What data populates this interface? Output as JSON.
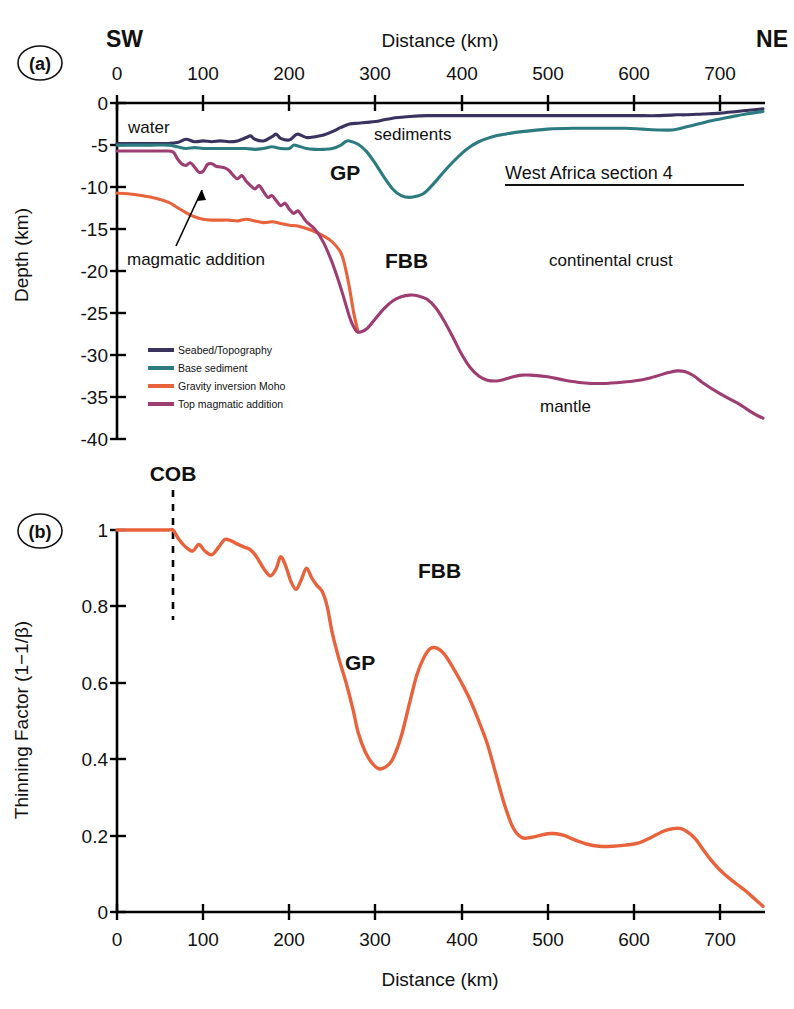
{
  "figure": {
    "caption_id_a": "(a)",
    "caption_id_b": "(b)",
    "orientation_left": "SW",
    "orientation_right": "NE",
    "section_title": "West Africa section 4"
  },
  "panel_a": {
    "axis": {
      "x_title": "Distance (km)",
      "y_title": "Depth (km)",
      "x_ticks": [
        "0",
        "100",
        "200",
        "300",
        "400",
        "500",
        "600",
        "700"
      ],
      "y_ticks": [
        "0",
        "-5",
        "-10",
        "-15",
        "-20",
        "-25",
        "-30",
        "-35",
        "-40"
      ]
    },
    "legend": [
      {
        "label": "Seabed/Topography",
        "color": "#3a3360"
      },
      {
        "label": "Base sediment",
        "color": "#2c7b80"
      },
      {
        "label": "Gravity inversion Moho",
        "color": "#e8623c"
      },
      {
        "label": "Top magmatic addition",
        "color": "#9e3d72"
      }
    ],
    "annotations": [
      {
        "name": "water",
        "text": "water"
      },
      {
        "name": "sediments",
        "text": "sediments"
      },
      {
        "name": "gp",
        "text": "GP"
      },
      {
        "name": "fbb",
        "text": "FBB"
      },
      {
        "name": "continental-crust",
        "text": "continental crust"
      },
      {
        "name": "mantle",
        "text": "mantle"
      },
      {
        "name": "magmatic-addition",
        "text": "magmatic addition"
      },
      {
        "name": "section-title",
        "text": "West Africa section 4"
      }
    ]
  },
  "panel_b": {
    "axis": {
      "x_title": "Distance (km)",
      "y_title": "Thinning Factor (1−1/β)",
      "x_ticks": [
        "0",
        "100",
        "200",
        "300",
        "400",
        "500",
        "600",
        "700"
      ],
      "y_ticks": [
        "0",
        "0.2",
        "0.4",
        "0.6",
        "0.8",
        "1"
      ]
    },
    "annotations": [
      {
        "name": "cob",
        "text": "COB"
      },
      {
        "name": "gp",
        "text": "GP"
      },
      {
        "name": "fbb",
        "text": "FBB"
      }
    ]
  },
  "chart_data": [
    {
      "type": "line",
      "id": "panel-a-crustal-section",
      "title": "West Africa section 4",
      "xlabel": "Distance (km)",
      "ylabel": "Depth (km)",
      "xlim": [
        0,
        750
      ],
      "ylim": [
        -40,
        0
      ],
      "grid": false,
      "legend_position": "lower-left",
      "series": [
        {
          "name": "Seabed/Topography",
          "color": "#3a3360",
          "x": [
            0,
            20,
            40,
            60,
            70,
            80,
            90,
            100,
            110,
            120,
            130,
            140,
            150,
            155,
            160,
            170,
            180,
            185,
            190,
            200,
            205,
            210,
            220,
            230,
            240,
            250,
            260,
            270,
            280,
            290,
            300,
            310,
            320,
            330,
            340,
            360,
            380,
            400,
            430,
            460,
            500,
            540,
            570,
            600,
            630,
            650,
            660,
            680,
            700,
            720,
            740,
            750
          ],
          "y": [
            -4.8,
            -4.8,
            -4.8,
            -4.8,
            -4.7,
            -4.3,
            -4.6,
            -4.5,
            -4.6,
            -4.5,
            -4.6,
            -4.5,
            -4.1,
            -3.9,
            -4.3,
            -4.5,
            -4.0,
            -3.7,
            -4.2,
            -4.4,
            -4.0,
            -3.7,
            -4.1,
            -4.0,
            -3.8,
            -3.4,
            -2.9,
            -2.5,
            -2.4,
            -2.3,
            -2.2,
            -2.0,
            -1.8,
            -1.7,
            -1.6,
            -1.5,
            -1.5,
            -1.5,
            -1.5,
            -1.5,
            -1.5,
            -1.5,
            -1.5,
            -1.5,
            -1.5,
            -1.4,
            -1.4,
            -1.3,
            -1.2,
            -1.0,
            -0.8,
            -0.7
          ]
        },
        {
          "name": "Base sediment",
          "color": "#2c7b80",
          "x": [
            0,
            20,
            40,
            60,
            70,
            80,
            90,
            100,
            110,
            120,
            130,
            140,
            150,
            160,
            170,
            180,
            190,
            200,
            205,
            210,
            220,
            230,
            240,
            250,
            260,
            265,
            270,
            280,
            290,
            300,
            310,
            320,
            330,
            340,
            350,
            355,
            360,
            370,
            380,
            390,
            400,
            410,
            420,
            430,
            440,
            450,
            470,
            500,
            530,
            560,
            590,
            610,
            630,
            645,
            655,
            670,
            690,
            710,
            730,
            750
          ],
          "y": [
            -5.0,
            -5.0,
            -5.0,
            -5.0,
            -5.2,
            -5.4,
            -5.3,
            -5.4,
            -5.4,
            -5.4,
            -5.4,
            -5.4,
            -5.4,
            -5.5,
            -5.4,
            -5.2,
            -5.4,
            -5.4,
            -5.0,
            -5.1,
            -5.4,
            -5.5,
            -5.5,
            -5.4,
            -5.0,
            -4.6,
            -4.5,
            -4.9,
            -5.8,
            -7.2,
            -8.8,
            -10.2,
            -11.0,
            -11.2,
            -11.0,
            -10.8,
            -10.4,
            -9.3,
            -8.1,
            -7.0,
            -6.0,
            -5.2,
            -4.6,
            -4.2,
            -3.9,
            -3.7,
            -3.4,
            -3.1,
            -3.0,
            -3.0,
            -3.0,
            -3.1,
            -3.2,
            -3.2,
            -3.0,
            -2.6,
            -2.1,
            -1.7,
            -1.3,
            -1.0
          ]
        },
        {
          "name": "Gravity inversion Moho",
          "color": "#e8623c",
          "x": [
            0,
            15,
            30,
            45,
            60,
            70,
            80,
            90,
            100,
            110,
            120,
            130,
            140,
            150,
            160,
            170,
            180,
            190,
            200,
            210,
            220,
            230,
            240,
            250,
            260,
            265,
            270,
            275,
            280
          ],
          "y": [
            -10.7,
            -10.8,
            -11.0,
            -11.3,
            -11.8,
            -12.4,
            -13.0,
            -13.5,
            -13.8,
            -13.9,
            -13.9,
            -13.9,
            -14.0,
            -13.8,
            -14.0,
            -14.2,
            -14.1,
            -14.3,
            -14.5,
            -14.6,
            -14.9,
            -15.3,
            -15.8,
            -16.5,
            -17.8,
            -19.5,
            -22.0,
            -25.0,
            -27.2
          ]
        },
        {
          "name": "Top magmatic addition",
          "color": "#9e3d72",
          "x": [
            0,
            20,
            40,
            55,
            65,
            70,
            75,
            80,
            85,
            90,
            95,
            100,
            105,
            110,
            115,
            120,
            125,
            130,
            135,
            140,
            145,
            150,
            155,
            160,
            165,
            170,
            175,
            180,
            185,
            190,
            195,
            200,
            205,
            210,
            215,
            220,
            230,
            240,
            250,
            260,
            270,
            275,
            280,
            290,
            300,
            310,
            320,
            330,
            340,
            350,
            360,
            370,
            380,
            390,
            400,
            410,
            420,
            430,
            440,
            450,
            460,
            470,
            480,
            500,
            520,
            540,
            560,
            580,
            600,
            620,
            640,
            650,
            660,
            670,
            680,
            700,
            720,
            740,
            750
          ],
          "y": [
            -5.7,
            -5.7,
            -5.7,
            -5.7,
            -5.8,
            -6.6,
            -7.2,
            -7.4,
            -7.1,
            -7.6,
            -8.2,
            -8.1,
            -7.3,
            -7.2,
            -7.5,
            -7.6,
            -7.7,
            -8.0,
            -8.6,
            -9.0,
            -8.6,
            -9.3,
            -9.8,
            -10.2,
            -9.8,
            -10.5,
            -11.2,
            -11.0,
            -11.6,
            -12.2,
            -11.9,
            -12.6,
            -13.1,
            -12.8,
            -13.4,
            -14.1,
            -15.0,
            -16.6,
            -19.0,
            -22.0,
            -25.4,
            -26.6,
            -27.2,
            -26.8,
            -25.6,
            -24.4,
            -23.5,
            -23.0,
            -22.8,
            -22.9,
            -23.3,
            -24.3,
            -25.9,
            -27.8,
            -29.8,
            -31.4,
            -32.4,
            -32.9,
            -33.0,
            -32.8,
            -32.5,
            -32.3,
            -32.3,
            -32.5,
            -32.9,
            -33.2,
            -33.3,
            -33.2,
            -33.0,
            -32.6,
            -32.0,
            -31.8,
            -31.9,
            -32.4,
            -33.2,
            -34.5,
            -35.6,
            -36.9,
            -37.4
          ]
        }
      ],
      "annotations": [
        {
          "text": "water",
          "x": 35,
          "y": -2.2
        },
        {
          "text": "sediments",
          "x": 400,
          "y": -3.2
        },
        {
          "text": "GP",
          "x": 285,
          "y": -8.4
        },
        {
          "text": "FBB",
          "x": 400,
          "y": -19.6
        },
        {
          "text": "continental crust",
          "x": 600,
          "y": -19.6
        },
        {
          "text": "mantle",
          "x": 565,
          "y": -36.5
        },
        {
          "text": "magmatic addition",
          "x": 60,
          "y": -23.4
        },
        {
          "text": "West Africa section 4",
          "x": 590,
          "y": -12.8
        }
      ]
    },
    {
      "type": "line",
      "id": "panel-b-thinning-factor",
      "title": "",
      "xlabel": "Distance (km)",
      "ylabel": "Thinning Factor (1−1/β)",
      "xlim": [
        0,
        750
      ],
      "ylim": [
        0,
        1
      ],
      "grid": false,
      "cob_distance_km": 65,
      "series": [
        {
          "name": "Thinning factor",
          "color": "#e8623c",
          "x": [
            0,
            20,
            40,
            60,
            65,
            72,
            80,
            88,
            95,
            102,
            110,
            118,
            125,
            132,
            140,
            148,
            155,
            162,
            170,
            178,
            185,
            190,
            196,
            202,
            208,
            214,
            220,
            226,
            232,
            238,
            244,
            250,
            258,
            266,
            274,
            280,
            288,
            296,
            304,
            312,
            320,
            330,
            340,
            348,
            356,
            364,
            372,
            380,
            390,
            400,
            410,
            420,
            430,
            440,
            450,
            460,
            470,
            480,
            490,
            500,
            510,
            520,
            530,
            545,
            560,
            575,
            590,
            605,
            620,
            635,
            645,
            655,
            665,
            672,
            680,
            690,
            700,
            710,
            720,
            730,
            740,
            750
          ],
          "y": [
            1.0,
            1.0,
            1.0,
            1.0,
            1.0,
            0.975,
            0.955,
            0.945,
            0.962,
            0.945,
            0.935,
            0.955,
            0.975,
            0.972,
            0.963,
            0.955,
            0.948,
            0.93,
            0.9,
            0.88,
            0.9,
            0.93,
            0.905,
            0.865,
            0.845,
            0.87,
            0.9,
            0.875,
            0.855,
            0.84,
            0.8,
            0.73,
            0.66,
            0.6,
            0.53,
            0.47,
            0.42,
            0.39,
            0.375,
            0.38,
            0.4,
            0.46,
            0.55,
            0.62,
            0.665,
            0.69,
            0.69,
            0.675,
            0.64,
            0.6,
            0.555,
            0.5,
            0.44,
            0.36,
            0.28,
            0.22,
            0.195,
            0.195,
            0.2,
            0.205,
            0.205,
            0.2,
            0.19,
            0.178,
            0.172,
            0.172,
            0.175,
            0.18,
            0.195,
            0.212,
            0.218,
            0.218,
            0.205,
            0.19,
            0.165,
            0.135,
            0.11,
            0.09,
            0.072,
            0.055,
            0.035,
            0.015
          ]
        }
      ],
      "annotations": [
        {
          "text": "COB",
          "x": 65,
          "y": 1.06
        },
        {
          "text": "GP",
          "x": 300,
          "y": 0.53
        },
        {
          "text": "FBB",
          "x": 420,
          "y": 0.88
        }
      ]
    }
  ]
}
